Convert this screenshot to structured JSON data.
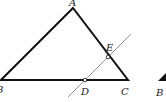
{
  "diagram": {
    "type": "geometry",
    "points": {
      "A": {
        "label": "A",
        "x": 73,
        "y": 8,
        "label_x": 69,
        "label_y": 6
      },
      "B": {
        "label": "B",
        "x": 1,
        "y": 80,
        "label_x": -4,
        "label_y": 93
      },
      "C": {
        "label": "C",
        "x": 128,
        "y": 80,
        "label_x": 121,
        "label_y": 95
      },
      "D": {
        "label": "D",
        "x": 85,
        "y": 80,
        "label_x": 81,
        "label_y": 95
      },
      "E": {
        "label": "E",
        "x": 108,
        "y": 57,
        "label_x": 106,
        "label_y": 51
      }
    },
    "segments": [
      {
        "name": "AB",
        "from": "A",
        "to": "B"
      },
      {
        "name": "AC",
        "from": "A",
        "to": "C"
      },
      {
        "name": "BC",
        "from": "B",
        "to": "C"
      }
    ],
    "secant_line": {
      "through": [
        "D",
        "E"
      ],
      "x1": 68,
      "y1": 97,
      "x2": 131,
      "y2": 34
    },
    "extra_partial_figure": {
      "label": "B",
      "label_x": 156,
      "label_y": 96
    }
  },
  "colors": {
    "triangle_stroke": "#111111",
    "secant_stroke": "#888888",
    "background": "#ffffff"
  }
}
